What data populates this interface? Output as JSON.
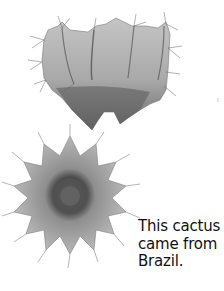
{
  "figure": {
    "top_specimen": {
      "label": "cactus-side-view",
      "tone": "#9a9a9a",
      "dark_tone": "#4a4a4a"
    },
    "bottom_specimen": {
      "label": "cactus-top-view",
      "tone": "#a8a8a8",
      "dark_tone": "#3e3e3e"
    }
  },
  "caption": {
    "lines": [
      "This cactus",
      "came from",
      "Brazil."
    ],
    "color": "#111111"
  }
}
